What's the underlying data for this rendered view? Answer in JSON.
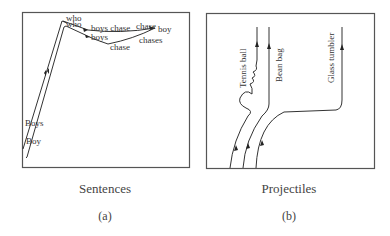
{
  "figure": {
    "panels": [
      {
        "id": "a",
        "caption": "Sentences",
        "sublabel": "(a)",
        "words": {
          "who_top": "who",
          "who_lower": "who",
          "boys_chase": "boys chase",
          "chase_right": "chase",
          "boy_right": "boy",
          "boys_mid": "boys",
          "chase_low": "chase",
          "chases": "chases",
          "boys_left": "Boys",
          "boy_left": "Boy"
        }
      },
      {
        "id": "b",
        "caption": "Projectiles",
        "sublabel": "(b)",
        "trajectories": [
          "Tennis ball",
          "Bean bag",
          "Glass tumbler"
        ]
      }
    ],
    "colors": {
      "line": "#333333",
      "frame": "#555555",
      "text": "#333333"
    }
  }
}
